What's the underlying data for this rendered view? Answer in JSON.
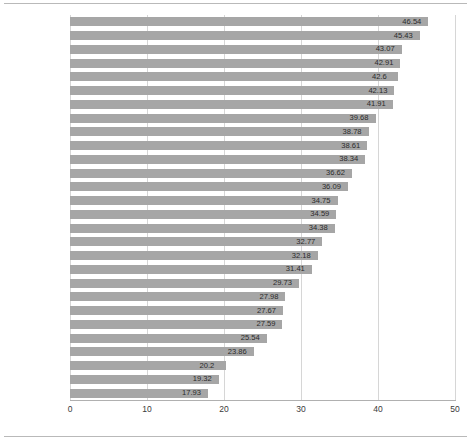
{
  "chart_data": {
    "type": "bar",
    "orientation": "horizontal",
    "title": "",
    "subtitle": "",
    "xlabel": "",
    "ylabel": "",
    "xlim": [
      0,
      50
    ],
    "xticks": [
      "0",
      "10",
      "20",
      "30",
      "40",
      "50"
    ],
    "grid": true,
    "legend": false,
    "bar_color": "#a6a6a6",
    "gridline_color": "#d6d6d6",
    "data_labels": true,
    "categories": [
      "덴마크",
      "프랑스",
      "벨기에",
      "이탈리아",
      "스웨덴",
      "오스트리아",
      "핀란드",
      "네덜란드",
      "그리스",
      "노르웨이",
      "독일",
      "스페인",
      "아이슬란드",
      "포르투갈",
      "캐나다",
      "체코",
      "영국",
      "뉴질랜드",
      "일본",
      "이스라엘",
      "한국",
      "호주",
      "스위스",
      "미국",
      "터키",
      "아일랜드",
      "칠레",
      "멕시코"
    ],
    "values": [
      46.54,
      45.43,
      43.07,
      42.91,
      42.6,
      42.13,
      41.91,
      39.68,
      38.78,
      38.61,
      38.34,
      36.62,
      36.09,
      34.75,
      34.59,
      34.38,
      32.77,
      32.18,
      31.41,
      29.73,
      27.98,
      27.67,
      27.59,
      25.54,
      23.86,
      20.2,
      19.32,
      17.93
    ],
    "value_labels": [
      "46.54",
      "45.43",
      "43.07",
      "42.91",
      "42.6",
      "42.13",
      "41.91",
      "39.68",
      "38.78",
      "38.61",
      "38.34",
      "36.62",
      "36.09",
      "34.75",
      "34.59",
      "34.38",
      "32.77",
      "32.18",
      "31.41",
      "29.73",
      "27.98",
      "27.67",
      "27.59",
      "25.54",
      "23.86",
      "20.2",
      "19.32",
      "17.93"
    ]
  }
}
